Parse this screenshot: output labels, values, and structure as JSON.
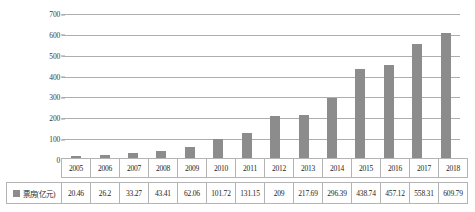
{
  "chart_data": {
    "type": "bar",
    "title": "",
    "xlabel": "",
    "ylabel": "",
    "ylim": [
      0,
      700
    ],
    "yticks": [
      700,
      600,
      500,
      400,
      300,
      200,
      100,
      0
    ],
    "grid": true,
    "legend_position": "table-left",
    "series_name": "票房(亿元)",
    "bar_color": "#8c8c8c",
    "categories": [
      "2005",
      "2006",
      "2007",
      "2008",
      "2009",
      "2010",
      "2011",
      "2012",
      "2013",
      "2014",
      "2015",
      "2016",
      "2017",
      "2018"
    ],
    "values": [
      20.46,
      26.2,
      33.27,
      43.41,
      62.06,
      101.72,
      131.15,
      209,
      217.69,
      296.39,
      438.74,
      457.12,
      558.31,
      609.79
    ],
    "value_labels": [
      "20.46",
      "26.2",
      "33.27",
      "43.41",
      "62.06",
      "101.72",
      "131.15",
      "209",
      "217.69",
      "296.39",
      "438.74",
      "457.12",
      "558.31",
      "609.79"
    ]
  },
  "table": {
    "row_label": "票房(亿元)",
    "years": [
      "2005",
      "2006",
      "2007",
      "2008",
      "2009",
      "2010",
      "2011",
      "2012",
      "2013",
      "2014",
      "2015",
      "2016",
      "2017",
      "2018"
    ],
    "values": [
      "20.46",
      "26.2",
      "33.27",
      "43.41",
      "62.06",
      "101.72",
      "131.15",
      "209",
      "217.69",
      "296.39",
      "438.74",
      "457.12",
      "558.31",
      "609.79"
    ]
  }
}
